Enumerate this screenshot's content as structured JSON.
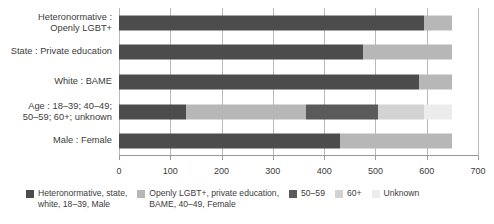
{
  "chart_data": {
    "type": "bar",
    "orientation": "horizontal",
    "stacked": true,
    "title": "",
    "xlabel": "",
    "ylabel": "",
    "xlim": [
      0,
      700
    ],
    "xticks": [
      0,
      100,
      200,
      300,
      400,
      500,
      600,
      700
    ],
    "xtick_labels": [
      "0",
      "100",
      "200",
      "300",
      "400",
      "500",
      "600",
      "700"
    ],
    "grid": true,
    "grid_axis": "x",
    "legend_position": "bottom",
    "categories": [
      "Heteronormative :\nOpenly LGBT+",
      "State : Private education",
      "White : BAME",
      "Age : 18–39; 40–49;\n50–59; 60+; unknown",
      "Male : Female"
    ],
    "series": [
      {
        "name": "Heteronormative, state,\nwhite, 18–39, Male",
        "color": "#4c4c4c",
        "values": [
          595,
          475,
          585,
          130,
          430
        ]
      },
      {
        "name": "Openly LGBT+, private education,\nBAME, 40–49, Female",
        "color": "#b7b7b7",
        "values": [
          55,
          175,
          65,
          235,
          220
        ]
      },
      {
        "name": "50–59",
        "color": "#5a5a5a",
        "values": [
          0,
          0,
          0,
          140,
          0
        ]
      },
      {
        "name": "60+",
        "color": "#d2d2d2",
        "values": [
          0,
          0,
          0,
          90,
          0
        ]
      },
      {
        "name": "Unknown",
        "color": "#ececec",
        "values": [
          0,
          0,
          0,
          55,
          0
        ]
      }
    ],
    "totals": [
      650,
      650,
      650,
      650,
      650
    ]
  },
  "axis": {
    "ticks": [
      {
        "value": "0",
        "pos": 0
      },
      {
        "value": "100",
        "pos": 100
      },
      {
        "value": "200",
        "pos": 200
      },
      {
        "value": "300",
        "pos": 300
      },
      {
        "value": "400",
        "pos": 400
      },
      {
        "value": "500",
        "pos": 500
      },
      {
        "value": "600",
        "pos": 600
      },
      {
        "value": "700",
        "pos": 700
      }
    ]
  },
  "legend": {
    "items": [
      {
        "label": "Heteronormative, state,\nwhite, 18–39, Male",
        "color": "#4c4c4c"
      },
      {
        "label": "Openly LGBT+, private education,\nBAME, 40–49, Female",
        "color": "#b7b7b7"
      },
      {
        "label": "50–59",
        "color": "#5a5a5a"
      },
      {
        "label": "60+",
        "color": "#d2d2d2"
      },
      {
        "label": "Unknown",
        "color": "#ececec"
      }
    ]
  },
  "colors": {
    "background": "#ffffff",
    "text": "#3c3c3c",
    "gridline": "#b9b9b9",
    "axis": "#9a9a9a"
  }
}
